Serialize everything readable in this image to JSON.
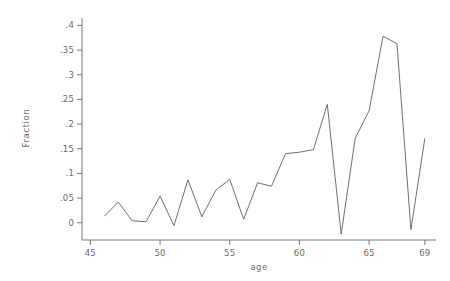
{
  "chart_data": {
    "type": "line",
    "title": "",
    "xlabel": "age",
    "ylabel": "Fraction",
    "xlim": [
      44.4,
      69.8
    ],
    "ylim": [
      -0.035,
      0.415
    ],
    "grid": false,
    "legend": "none",
    "line_color": "#4a4a4a",
    "axis_color": "#6b6b6b",
    "background": "#ffffff",
    "xticks": [
      45,
      50,
      55,
      60,
      65,
      69
    ],
    "xtick_labels": [
      "45",
      "50",
      "55",
      "60",
      "65",
      "69"
    ],
    "yticks": [
      0,
      0.05,
      0.1,
      0.15,
      0.2,
      0.25,
      0.3,
      0.35,
      0.4
    ],
    "ytick_labels": [
      "0",
      ".05",
      ".1",
      ".15",
      ".2",
      ".25",
      ".3",
      ".35",
      ".4"
    ],
    "x": [
      46,
      47,
      48,
      49,
      50,
      51,
      52,
      53,
      54,
      55,
      56,
      57,
      58,
      59,
      60,
      61,
      62,
      63,
      64,
      65,
      66,
      67,
      68,
      69
    ],
    "values": [
      0.013,
      0.042,
      0.004,
      0.002,
      0.054,
      -0.006,
      0.087,
      0.012,
      0.066,
      0.088,
      0.007,
      0.081,
      0.074,
      0.14,
      0.143,
      0.148,
      0.24,
      -0.023,
      0.171,
      0.227,
      0.378,
      0.363,
      -0.014,
      0.171
    ],
    "series": [
      {
        "name": "Fraction",
        "values": [
          0.013,
          0.042,
          0.004,
          0.002,
          0.054,
          -0.006,
          0.087,
          0.012,
          0.066,
          0.088,
          0.007,
          0.081,
          0.074,
          0.14,
          0.143,
          0.148,
          0.24,
          -0.023,
          0.171,
          0.227,
          0.378,
          0.363,
          -0.014,
          0.171
        ]
      }
    ]
  },
  "axes": {
    "y_axis_name": "y-axis",
    "x_axis_name": "x-axis"
  }
}
